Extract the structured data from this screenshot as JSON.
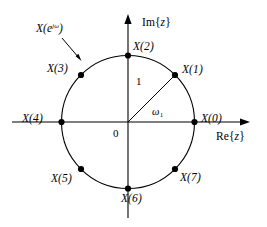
{
  "figure": {
    "axes": {
      "imaginary_label": "Im{",
      "imaginary_var": "z",
      "imaginary_close": "}",
      "real_label": "Re{",
      "real_var": "z",
      "real_close": "}",
      "origin_label": "0"
    },
    "circle": {
      "radius_label": "1",
      "angle_label": "ω",
      "angle_subscript": "1",
      "transform_label_base": "X(e",
      "transform_label_exponent": "jω",
      "transform_label_close": ")"
    },
    "samples": [
      {
        "name": "X(0)",
        "index": 0,
        "angle_deg": 0
      },
      {
        "name": "X(1)",
        "index": 1,
        "angle_deg": 45
      },
      {
        "name": "X(2)",
        "index": 2,
        "angle_deg": 90
      },
      {
        "name": "X(3)",
        "index": 3,
        "angle_deg": 135
      },
      {
        "name": "X(4)",
        "index": 4,
        "angle_deg": 180
      },
      {
        "name": "X(5)",
        "index": 5,
        "angle_deg": 225
      },
      {
        "name": "X(6)",
        "index": 6,
        "angle_deg": 270
      },
      {
        "name": "X(7)",
        "index": 7,
        "angle_deg": 315
      }
    ],
    "colors": {
      "stroke": "#000000",
      "background": "#ffffff"
    }
  }
}
